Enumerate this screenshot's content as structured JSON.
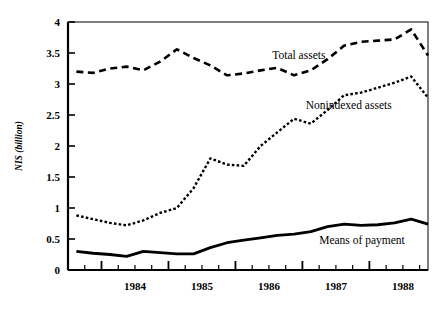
{
  "chart_data": {
    "type": "line",
    "title": "",
    "xlabel": "",
    "ylabel": "NIS (billion)",
    "ylim": [
      0,
      4
    ],
    "xlim": [
      1983.5,
      1988.875
    ],
    "grid": false,
    "legend": "inline-annotations",
    "y_ticks": [
      "0",
      "0.5",
      "1",
      "1.5",
      "2",
      "2.5",
      "3",
      "3.5",
      "4"
    ],
    "y_tick_values": [
      0,
      0.5,
      1,
      1.5,
      2,
      2.5,
      3,
      3.5,
      4
    ],
    "x_ticks": [
      "1984",
      "1985",
      "1986",
      "1987",
      "1988"
    ],
    "x_tick_values": [
      1984,
      1985,
      1986,
      1987,
      1988
    ],
    "x_minor_step": 0.25,
    "series": [
      {
        "name": "Total assets",
        "style": "dashed",
        "color": "#000000",
        "label_x": 1986.55,
        "label_y": 3.4,
        "x": [
          1983.625,
          1983.875,
          1984.125,
          1984.375,
          1984.625,
          1984.875,
          1985.125,
          1985.375,
          1985.625,
          1985.875,
          1986.125,
          1986.375,
          1986.625,
          1986.875,
          1987.125,
          1987.375,
          1987.625,
          1987.875,
          1988.125,
          1988.375,
          1988.625,
          1988.875
        ],
        "values": [
          3.2,
          3.18,
          3.25,
          3.28,
          3.22,
          3.36,
          3.56,
          3.42,
          3.3,
          3.14,
          3.17,
          3.22,
          3.26,
          3.14,
          3.22,
          3.4,
          3.62,
          3.68,
          3.7,
          3.72,
          3.88,
          3.46
        ]
      },
      {
        "name": "Nonindexed assets",
        "style": "dotted",
        "color": "#000000",
        "label_x": 1987.05,
        "label_y": 2.6,
        "x": [
          1983.625,
          1983.875,
          1984.125,
          1984.375,
          1984.625,
          1984.875,
          1985.125,
          1985.375,
          1985.625,
          1985.875,
          1986.125,
          1986.375,
          1986.625,
          1986.875,
          1987.125,
          1987.375,
          1987.625,
          1987.875,
          1988.125,
          1988.375,
          1988.625,
          1988.875
        ],
        "values": [
          0.88,
          0.82,
          0.76,
          0.72,
          0.8,
          0.92,
          1.0,
          1.32,
          1.8,
          1.7,
          1.68,
          2.0,
          2.22,
          2.44,
          2.36,
          2.58,
          2.82,
          2.86,
          2.94,
          3.02,
          3.12,
          2.78
        ]
      },
      {
        "name": "Means of payment",
        "style": "solid",
        "color": "#000000",
        "label_x": 1987.25,
        "label_y": 0.42,
        "x": [
          1983.625,
          1983.875,
          1984.125,
          1984.375,
          1984.625,
          1984.875,
          1985.125,
          1985.375,
          1985.625,
          1985.875,
          1986.125,
          1986.375,
          1986.625,
          1986.875,
          1987.125,
          1987.375,
          1987.625,
          1987.875,
          1988.125,
          1988.375,
          1988.625,
          1988.875
        ],
        "values": [
          0.3,
          0.27,
          0.25,
          0.22,
          0.3,
          0.28,
          0.26,
          0.26,
          0.36,
          0.44,
          0.48,
          0.52,
          0.56,
          0.58,
          0.62,
          0.7,
          0.74,
          0.72,
          0.73,
          0.76,
          0.82,
          0.74
        ]
      }
    ]
  }
}
